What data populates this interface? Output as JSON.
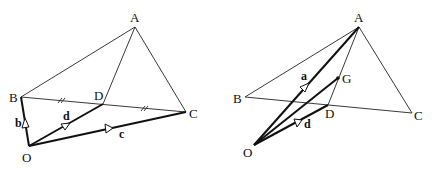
{
  "figures": [
    {
      "id": "left",
      "points": {
        "A": {
          "label": "A"
        },
        "B": {
          "label": "B"
        },
        "C": {
          "label": "C"
        },
        "D": {
          "label": "D"
        },
        "O": {
          "label": "O"
        }
      },
      "vectors": {
        "b": {
          "label": "b",
          "from": "O",
          "to": "B"
        },
        "d": {
          "label": "d",
          "from": "O",
          "to": "D"
        },
        "c": {
          "label": "c",
          "from": "O",
          "to": "C"
        }
      },
      "annotations": "Equal tick marks on BD and DC (D is midpoint of BC)"
    },
    {
      "id": "right",
      "points": {
        "A": {
          "label": "A"
        },
        "B": {
          "label": "B"
        },
        "C": {
          "label": "C"
        },
        "D": {
          "label": "D"
        },
        "G": {
          "label": "G"
        },
        "O": {
          "label": "O"
        }
      },
      "vectors": {
        "a": {
          "label": "a",
          "from": "O",
          "to": "A"
        },
        "d": {
          "label": "d",
          "from": "O",
          "to": "D"
        }
      }
    }
  ]
}
